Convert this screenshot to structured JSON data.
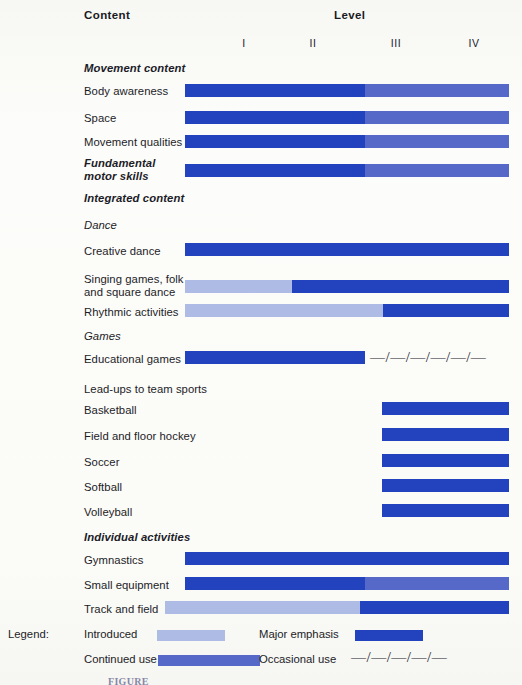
{
  "header": {
    "content_label": "Content",
    "level_label": "Level"
  },
  "levels": [
    {
      "label": "I",
      "x": 244
    },
    {
      "label": "II",
      "x": 313
    },
    {
      "label": "III",
      "x": 396
    },
    {
      "label": "IV",
      "x": 474
    }
  ],
  "colors": {
    "introduced": "#aebbe4",
    "continued_use": "#5669c8",
    "major_emphasis": "#2342bd",
    "text": "#1c1c28",
    "paper": "#fbfbf8"
  },
  "rows": [
    {
      "label": "Movement content",
      "style": "bolditalic",
      "y": 62,
      "bar": null
    },
    {
      "label": "Body awareness",
      "style": "plain",
      "y": 85,
      "bar": {
        "x": 185,
        "width": 324,
        "y": 84,
        "segments": [
          {
            "color": "major_emphasis",
            "width": 180
          },
          {
            "color": "continued_use",
            "width": 144
          }
        ]
      }
    },
    {
      "label": "Space",
      "style": "plain",
      "y": 112,
      "bar": {
        "x": 185,
        "width": 324,
        "y": 111,
        "segments": [
          {
            "color": "major_emphasis",
            "width": 180
          },
          {
            "color": "continued_use",
            "width": 144
          }
        ]
      }
    },
    {
      "label": "Movement qualities",
      "style": "plain",
      "y": 136,
      "bar": {
        "x": 185,
        "width": 324,
        "y": 135,
        "segments": [
          {
            "color": "major_emphasis",
            "width": 180
          },
          {
            "color": "continued_use",
            "width": 144
          }
        ]
      }
    },
    {
      "label": "Fundamental\nmotor skills",
      "style": "bolditalic",
      "y": 157,
      "bar": {
        "x": 185,
        "width": 324,
        "y": 164,
        "segments": [
          {
            "color": "major_emphasis",
            "width": 180
          },
          {
            "color": "continued_use",
            "width": 144
          }
        ]
      }
    },
    {
      "label": "Integrated content",
      "style": "bolditalic",
      "y": 192,
      "bar": null
    },
    {
      "label": "Dance",
      "style": "italic",
      "y": 219,
      "bar": null
    },
    {
      "label": "Creative dance",
      "style": "plain",
      "y": 245,
      "bar": {
        "x": 185,
        "width": 324,
        "y": 243,
        "segments": [
          {
            "color": "major_emphasis",
            "width": 324
          }
        ]
      }
    },
    {
      "label": "Singing games, folk\nand square dance",
      "style": "plain",
      "y": 273,
      "bar": {
        "x": 185,
        "width": 324,
        "y": 280,
        "segments": [
          {
            "color": "introduced",
            "width": 107
          },
          {
            "color": "major_emphasis",
            "width": 217
          }
        ]
      }
    },
    {
      "label": "Rhythmic activities",
      "style": "plain",
      "y": 306,
      "bar": {
        "x": 185,
        "width": 324,
        "y": 304,
        "segments": [
          {
            "color": "introduced",
            "width": 198
          },
          {
            "color": "major_emphasis",
            "width": 126
          }
        ]
      }
    },
    {
      "label": "Games",
      "style": "italic",
      "y": 330,
      "bar": null
    },
    {
      "label": "Educational games",
      "style": "plain",
      "y": 353,
      "bar": {
        "x": 185,
        "width": 180,
        "y": 351,
        "segments": [
          {
            "color": "major_emphasis",
            "width": 180
          }
        ]
      },
      "dashes": {
        "x": 370,
        "y": 350,
        "text": "—/—/—/—/—/—"
      }
    },
    {
      "label": "Lead-ups to team sports",
      "style": "plain",
      "y": 383,
      "bar": null
    },
    {
      "label": "Basketball",
      "style": "plain",
      "y": 404,
      "bar": {
        "x": 382,
        "width": 127,
        "y": 402,
        "segments": [
          {
            "color": "major_emphasis",
            "width": 127
          }
        ]
      }
    },
    {
      "label": "Field and floor hockey",
      "style": "plain",
      "y": 430,
      "bar": {
        "x": 382,
        "width": 127,
        "y": 428,
        "segments": [
          {
            "color": "major_emphasis",
            "width": 127
          }
        ]
      }
    },
    {
      "label": "Soccer",
      "style": "plain",
      "y": 456,
      "bar": {
        "x": 382,
        "width": 127,
        "y": 454,
        "segments": [
          {
            "color": "major_emphasis",
            "width": 127
          }
        ]
      }
    },
    {
      "label": "Softball",
      "style": "plain",
      "y": 481,
      "bar": {
        "x": 382,
        "width": 127,
        "y": 479,
        "segments": [
          {
            "color": "major_emphasis",
            "width": 127
          }
        ]
      }
    },
    {
      "label": "Volleyball",
      "style": "plain",
      "y": 506,
      "bar": {
        "x": 382,
        "width": 127,
        "y": 504,
        "segments": [
          {
            "color": "major_emphasis",
            "width": 127
          }
        ]
      }
    },
    {
      "label": "Individual activities",
      "style": "bolditalic",
      "y": 531,
      "bar": null
    },
    {
      "label": "Gymnastics",
      "style": "plain",
      "y": 554,
      "bar": {
        "x": 185,
        "width": 324,
        "y": 552,
        "segments": [
          {
            "color": "major_emphasis",
            "width": 324
          }
        ]
      }
    },
    {
      "label": "Small equipment",
      "style": "plain",
      "y": 579,
      "bar": {
        "x": 185,
        "width": 324,
        "y": 577,
        "segments": [
          {
            "color": "major_emphasis",
            "width": 180
          },
          {
            "color": "continued_use",
            "width": 144
          }
        ]
      }
    },
    {
      "label": "Track and field",
      "style": "plain",
      "y": 603,
      "bar": {
        "x": 165,
        "width": 344,
        "y": 601,
        "segments": [
          {
            "color": "introduced",
            "width": 195
          },
          {
            "color": "major_emphasis",
            "width": 149
          }
        ]
      }
    }
  ],
  "legend": {
    "title": "Legend:",
    "items": [
      {
        "label": "Introduced",
        "label_x": 84,
        "label_y": 8,
        "swatch_x": 157,
        "swatch_y": 10,
        "swatch_w": 68,
        "color": "introduced"
      },
      {
        "label": "Major emphasis",
        "label_x": 259,
        "label_y": 8,
        "swatch_x": 355,
        "swatch_y": 10,
        "swatch_w": 68,
        "color": "major_emphasis"
      },
      {
        "label": "Continued use",
        "label_x": 84,
        "label_y": 33,
        "swatch_x": 158,
        "swatch_y": 35,
        "swatch_w": 102,
        "color": "continued_use"
      }
    ],
    "occasional": {
      "label": "Occasional use",
      "label_x": 259,
      "label_y": 33,
      "dashes": "—/—/—/—/—",
      "dashes_x": 351,
      "dashes_y": 29
    }
  },
  "caption": "FIGURE"
}
